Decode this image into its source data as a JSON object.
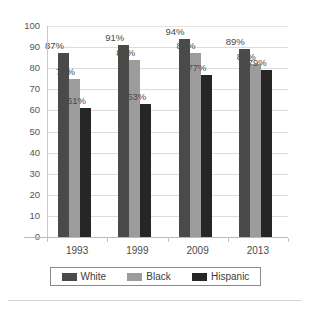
{
  "chart_data": {
    "type": "bar",
    "title": "",
    "xlabel": "",
    "ylabel": "",
    "categories": [
      "1993",
      "1999",
      "2009",
      "2013"
    ],
    "series": [
      {
        "name": "White",
        "color": "#4a4a4a",
        "values": [
          87,
          91,
          94,
          89
        ],
        "labels": [
          "87%",
          "91%",
          "94%",
          "89%"
        ]
      },
      {
        "name": "Black",
        "color": "#9c9c9c",
        "values": [
          75,
          84,
          87,
          82
        ],
        "labels": [
          "75%",
          "84%",
          "87%",
          "82%"
        ]
      },
      {
        "name": "Hispanic",
        "color": "#262626",
        "values": [
          61,
          63,
          77,
          79
        ],
        "labels": [
          "61%",
          "63%",
          "77%",
          "79%"
        ]
      }
    ],
    "ylim": [
      0,
      100
    ],
    "ytick_step": 10,
    "ytick_labels": [
      "100",
      "90",
      "80",
      "70",
      "60",
      "50",
      "40",
      "30",
      "20",
      "10",
      "0"
    ],
    "grid": true,
    "legend_position": "bottom",
    "value_label_suffix": "%"
  },
  "legend": {
    "entries": [
      {
        "label": "White"
      },
      {
        "label": "Black"
      },
      {
        "label": "Hispanic"
      }
    ]
  }
}
